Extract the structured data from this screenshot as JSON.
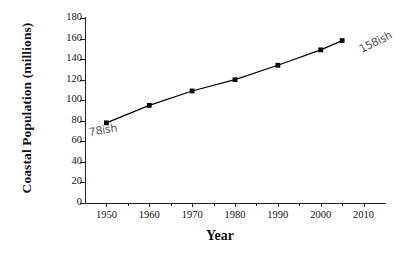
{
  "chart_data": {
    "type": "line",
    "title": "",
    "subtitle": "",
    "xlabel": "Year",
    "ylabel": "Coastal Population (millions)",
    "xlim": [
      1945,
      2015
    ],
    "ylim": [
      0,
      180
    ],
    "grid": false,
    "legend": null,
    "x": [
      1950,
      1960,
      1970,
      1980,
      1990,
      2000,
      2005
    ],
    "values": [
      78,
      95,
      109,
      120,
      134,
      149,
      158
    ],
    "series": [
      {
        "name": "Coastal Population",
        "x": [
          1950,
          1960,
          1970,
          1980,
          1990,
          2000,
          2005
        ],
        "values": [
          78,
          95,
          109,
          120,
          134,
          149,
          158
        ],
        "marker": "square",
        "color": "#000000"
      }
    ],
    "xticks": [
      1950,
      1960,
      1970,
      1980,
      1990,
      2000,
      2010
    ],
    "xtick_labels": [
      "1950",
      "1960",
      "1970",
      "1980",
      "1990",
      "2000",
      "2010"
    ],
    "xminor_ticks": [
      1955,
      1965,
      1975,
      1985,
      1995,
      2005
    ],
    "yticks": [
      0,
      20,
      40,
      60,
      80,
      100,
      120,
      140,
      160,
      180
    ],
    "ytick_labels": [
      "0",
      "20",
      "40",
      "60",
      "80",
      "100",
      "120",
      "140",
      "160",
      "180"
    ],
    "annotations": [
      {
        "text": "78ish",
        "x": 1950,
        "y": 78,
        "style": "handwritten",
        "color": "#555555"
      },
      {
        "text": "158ish",
        "x": 2005,
        "y": 158,
        "style": "handwritten",
        "color": "#555555"
      }
    ]
  },
  "axes": {
    "ylabel": "Coastal Population (millions)",
    "xlabel": "Year"
  },
  "annotations": {
    "start": "78ish",
    "end": "158ish"
  }
}
